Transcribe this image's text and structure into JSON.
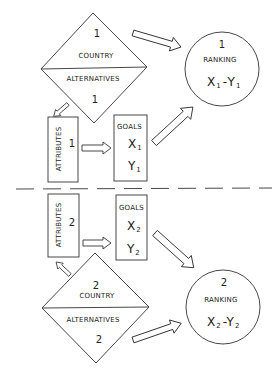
{
  "colors": {
    "stroke": "#333333",
    "text": "#222222",
    "background": "#ffffff"
  },
  "top": {
    "country": {
      "number": "1",
      "upper_label": "COUNTRY",
      "lower_label": "ALTERNATIVES",
      "lower_number": "1"
    },
    "attributes": {
      "label": "ATTRIBUTES",
      "number": "1"
    },
    "goals": {
      "label": "GOALS",
      "x": "X",
      "x_sub": "1",
      "y": "Y",
      "y_sub": "1"
    },
    "ranking": {
      "number": "1",
      "label": "RANKING",
      "x": "X",
      "x_sub": "1",
      "sep": "-",
      "y": "Y",
      "y_sub": "1"
    }
  },
  "bottom": {
    "country": {
      "number": "2",
      "upper_label": "COUNTRY",
      "lower_label": "ALTERNATIVES",
      "lower_number": "2"
    },
    "attributes": {
      "label": "ATTRIBUTES",
      "number": "2"
    },
    "goals": {
      "label": "GOALS",
      "x": "X",
      "x_sub": "2",
      "y": "Y",
      "y_sub": "2"
    },
    "ranking": {
      "number": "2",
      "label": "RANKING",
      "x": "X",
      "x_sub": "2",
      "sep": "-",
      "y": "Y",
      "y_sub": "2"
    }
  }
}
